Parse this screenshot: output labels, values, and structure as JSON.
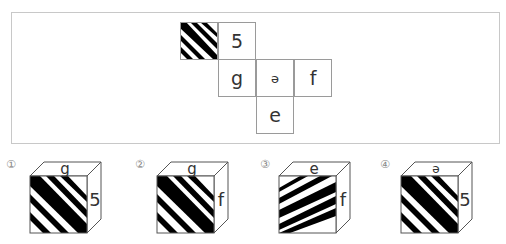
{
  "net": {
    "cells": [
      {
        "id": "pattern",
        "label": "",
        "col": 0,
        "row": 0,
        "pattern": "diagonal-stripes"
      },
      {
        "id": "five",
        "label": "5",
        "col": 1,
        "row": 0
      },
      {
        "id": "g",
        "label": "g",
        "col": 1,
        "row": 1
      },
      {
        "id": "schwa",
        "label": "ə",
        "col": 2,
        "row": 1
      },
      {
        "id": "f",
        "label": "f",
        "col": 3,
        "row": 1
      },
      {
        "id": "e",
        "label": "e",
        "col": 2,
        "row": 2
      }
    ],
    "labels": {
      "five": "5",
      "g": "g",
      "schwa": "ə",
      "f": "f",
      "e": "e"
    }
  },
  "options": [
    {
      "number": "①",
      "top": "g",
      "right": "5",
      "front": "stripes-down-right"
    },
    {
      "number": "②",
      "top": "g",
      "right": "f",
      "front": "stripes-down-right"
    },
    {
      "number": "③",
      "top": "e",
      "right": "f",
      "front": "stripes-shallow-up-right"
    },
    {
      "number": "④",
      "top": "ə",
      "right": "5",
      "front": "stripes-down-right"
    }
  ],
  "colors": {
    "stripe": "#000000",
    "border": "#9a9a9a",
    "frame": "#c8c8c8"
  }
}
